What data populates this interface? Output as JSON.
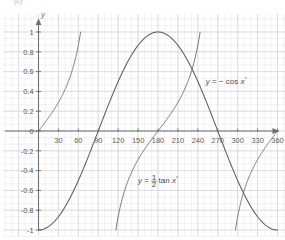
{
  "figure": {
    "caption": "(c)",
    "background_color": "#ffffff",
    "grid_minor_color": "#e9e9ec",
    "grid_major_color": "#d5d5da",
    "axis_color": "#6f6f6f",
    "curve_color": "#5d5d5d"
  },
  "chart_data": {
    "type": "line",
    "title": "",
    "xlabel": "",
    "ylabel": "y",
    "xlim": [
      -12,
      378
    ],
    "ylim": [
      -1.12,
      1.12
    ],
    "grid": true,
    "grid_major_x_step": 30,
    "grid_major_y_step": 0.2,
    "grid_minor_per_major": 3,
    "legend_position": "inline-annotations",
    "x_ticks": [
      30,
      60,
      90,
      120,
      150,
      180,
      210,
      240,
      270,
      300,
      330,
      360
    ],
    "x_tick_labels": [
      "30",
      "60",
      "90",
      "120",
      "150",
      "180",
      "210",
      "240",
      "270",
      "300",
      "330",
      "360"
    ],
    "y_ticks": [
      1,
      0.8,
      0.6,
      0.4,
      0.2,
      0,
      -0.2,
      -0.4,
      -0.6,
      -0.8,
      -1
    ],
    "y_tick_labels": [
      "1",
      "0.8",
      "0.6",
      "0.4",
      "0.2",
      "0",
      "-0.2",
      "-0.4",
      "-0.6",
      "-0.8",
      "-1"
    ],
    "series": [
      {
        "name": "y = -cos x°",
        "annotation": "y = − cos x°",
        "annotation_x": 252,
        "annotation_y": 0.47,
        "formula": "-cos(x)",
        "x": [
          0,
          10,
          20,
          30,
          40,
          50,
          60,
          70,
          80,
          90,
          100,
          110,
          120,
          130,
          140,
          150,
          160,
          170,
          180,
          190,
          200,
          210,
          220,
          230,
          240,
          250,
          260,
          270,
          280,
          290,
          300,
          310,
          320,
          330,
          340,
          350,
          360
        ],
        "values": [
          -1,
          -0.985,
          -0.94,
          -0.866,
          -0.766,
          -0.643,
          -0.5,
          -0.342,
          -0.174,
          0,
          0.174,
          0.342,
          0.5,
          0.643,
          0.766,
          0.866,
          0.94,
          0.985,
          1,
          0.985,
          0.94,
          0.866,
          0.766,
          0.643,
          0.5,
          0.342,
          0.174,
          0,
          -0.174,
          -0.342,
          -0.5,
          -0.643,
          -0.766,
          -0.866,
          -0.94,
          -0.985,
          -1
        ]
      },
      {
        "name": "y = 1/2 tan x°",
        "annotation": "y = ½ tan x°",
        "annotation_numerator": "1",
        "annotation_denominator": "2",
        "annotation_x": 150,
        "annotation_y": -0.53,
        "formula": "0.5*tan(x)",
        "branches": [
          {
            "x_start": 0,
            "x_end": 63.4,
            "y_start": 0,
            "y_end": 1
          },
          {
            "x_start": 116.6,
            "x_end": 243.4,
            "y_start": -1,
            "y_end": 1
          },
          {
            "x_start": 296.6,
            "x_end": 360,
            "y_start": -1,
            "y_end": 0
          }
        ],
        "asymptotes": [
          90,
          270
        ]
      }
    ]
  }
}
